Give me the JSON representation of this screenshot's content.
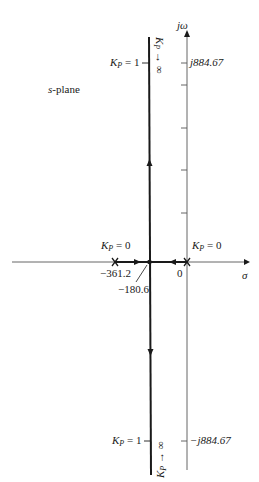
{
  "diagram": {
    "plane_label_prefix": "s",
    "plane_label_suffix": "-plane",
    "axes": {
      "imag_label": "jω",
      "real_label": "σ",
      "origin_label": "0"
    },
    "poles": [
      {
        "value": "-361.2",
        "gain_label_k": "K",
        "gain_label_sub": "P",
        "gain_label_eq": " = 0"
      },
      {
        "value": "0",
        "gain_label_k": "K",
        "gain_label_sub": "P",
        "gain_label_eq": " = 0"
      }
    ],
    "breakaway_point": "−180.6",
    "pole_left_label": "−361.2",
    "upper_crossing": {
      "gain_k": "K",
      "gain_sub": "P",
      "gain_eq": " = 1",
      "value": "j884.67",
      "infinity_k": "K",
      "infinity_sub": "P",
      "infinity_arrow": "→ ∞"
    },
    "lower_crossing": {
      "gain_k": "K",
      "gain_sub": "P",
      "gain_eq": " = 1",
      "value": "−j884.67",
      "infinity_k": "K",
      "infinity_sub": "P",
      "infinity_arrow": "→ ∞"
    },
    "colors": {
      "ink": "#1a1a1a",
      "axis": "#555555"
    }
  }
}
